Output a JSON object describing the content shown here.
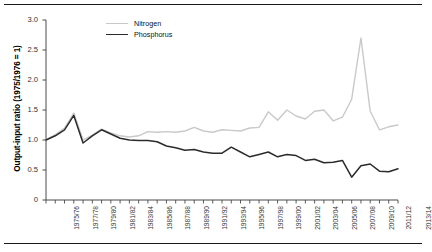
{
  "figure": {
    "has_top_rule": true,
    "has_bottom_rule": true
  },
  "legend": {
    "position": "top-left-inside",
    "entries": [
      {
        "label": "Nitrogen",
        "color": "#c9c9c9",
        "icon": "line-swatch-icon"
      },
      {
        "label": "Phosphorus",
        "color": "#2b2b2b",
        "icon": "line-swatch-icon"
      }
    ]
  },
  "chart_data": {
    "type": "line",
    "title": "",
    "subtitle": "",
    "xlabel": "",
    "ylabel": "Output-input ratio (1975/1976 = 1)",
    "ylim": [
      0,
      3.0
    ],
    "yticks": [
      "0",
      "0.5",
      "1.0",
      "1.5",
      "2.0",
      "2.5",
      "3.0"
    ],
    "ytick_values": [
      0,
      0.5,
      1.0,
      1.5,
      2.0,
      2.5,
      3.0
    ],
    "grid": false,
    "legend_position": "top-left",
    "x": [
      "1975/76",
      "1976/77",
      "1977/78",
      "1978/79",
      "1979/80",
      "1980/81",
      "1981/82",
      "1982/83",
      "1983/84",
      "1984/85",
      "1985/86",
      "1986/87",
      "1987/88",
      "1988/89",
      "1989/90",
      "1990/91",
      "1991/92",
      "1992/93",
      "1993/94",
      "1994/95",
      "1995/96",
      "1996/97",
      "1997/98",
      "1998/99",
      "1999/00",
      "2000/01",
      "2001/02",
      "2002/03",
      "2003/04",
      "2004/05",
      "2005/06",
      "2006/07",
      "2007/08",
      "2008/09",
      "2009/10",
      "2010/11",
      "2011/12",
      "2012/13",
      "2013/14"
    ],
    "xtick_labels_shown": [
      "1975/76",
      "1977/78",
      "1979/80",
      "1981/82",
      "1983/84",
      "1985/86",
      "1987/88",
      "1989/90",
      "1991/92",
      "1993/94",
      "1995/96",
      "1997/98",
      "1999/00",
      "2001/02",
      "2003/04",
      "2005/06",
      "2007/08",
      "2009/10",
      "2011/12",
      "2013/14"
    ],
    "series": [
      {
        "name": "Nitrogen",
        "color": "#c9c9c9",
        "values": [
          1.0,
          1.09,
          1.2,
          1.45,
          1.0,
          1.08,
          1.18,
          1.12,
          1.07,
          1.05,
          1.07,
          1.14,
          1.13,
          1.14,
          1.13,
          1.15,
          1.21,
          1.15,
          1.13,
          1.17,
          1.16,
          1.15,
          1.2,
          1.21,
          1.47,
          1.33,
          1.5,
          1.4,
          1.35,
          1.48,
          1.5,
          1.32,
          1.38,
          1.68,
          2.7,
          1.48,
          1.17,
          1.22,
          1.25
        ]
      },
      {
        "name": "Phosphorus",
        "color": "#2b2b2b",
        "values": [
          1.0,
          1.07,
          1.17,
          1.41,
          0.95,
          1.07,
          1.17,
          1.1,
          1.03,
          1.0,
          0.99,
          0.99,
          0.97,
          0.9,
          0.87,
          0.83,
          0.84,
          0.8,
          0.78,
          0.78,
          0.88,
          0.8,
          0.72,
          0.76,
          0.8,
          0.72,
          0.76,
          0.74,
          0.66,
          0.68,
          0.62,
          0.63,
          0.66,
          0.38,
          0.57,
          0.6,
          0.48,
          0.47,
          0.52
        ]
      }
    ]
  }
}
